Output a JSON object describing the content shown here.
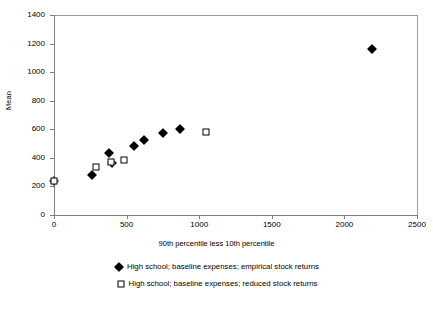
{
  "chart_data": {
    "type": "scatter",
    "title": "",
    "xlabel": "90th percentile less 10th percentile",
    "ylabel": "Mean",
    "xlim": [
      0,
      2500
    ],
    "ylim": [
      0,
      1400
    ],
    "xticks": [
      0,
      500,
      1000,
      1500,
      2000,
      2500
    ],
    "yticks": [
      0,
      200,
      400,
      600,
      800,
      1000,
      1200,
      1400
    ],
    "grid": false,
    "legend_position": "bottom",
    "series": [
      {
        "name": "High school; baseline expenses; empirical stock returns",
        "marker": "filled-diamond",
        "color": "#000000",
        "points": [
          {
            "x": 0,
            "y": 240
          },
          {
            "x": 260,
            "y": 283
          },
          {
            "x": 380,
            "y": 433
          },
          {
            "x": 400,
            "y": 365
          },
          {
            "x": 550,
            "y": 485
          },
          {
            "x": 620,
            "y": 528
          },
          {
            "x": 750,
            "y": 572
          },
          {
            "x": 870,
            "y": 605
          },
          {
            "x": 2190,
            "y": 1165
          }
        ]
      },
      {
        "name": "High school; baseline expenses; reduced stock returns",
        "marker": "open-square",
        "color": "#000000",
        "points": [
          {
            "x": 0,
            "y": 237
          },
          {
            "x": 290,
            "y": 338
          },
          {
            "x": 395,
            "y": 368
          },
          {
            "x": 480,
            "y": 387
          },
          {
            "x": 1050,
            "y": 582
          }
        ]
      }
    ]
  },
  "axes": {
    "x_tick_labels": [
      "0",
      "500",
      "1000",
      "1500",
      "2000",
      "2500"
    ],
    "y_tick_labels": [
      "0",
      "200",
      "400",
      "600",
      "800",
      "1000",
      "1200",
      "1400"
    ],
    "x_axis_label": "90th percentile less 10th percentile",
    "y_axis_label": "Mean"
  },
  "legend": {
    "entries": [
      {
        "label": "High school; baseline expenses; empirical stock returns",
        "marker": "filled-diamond"
      },
      {
        "label": "High school; baseline expenses; reduced stock returns",
        "marker": "open-square"
      }
    ]
  }
}
